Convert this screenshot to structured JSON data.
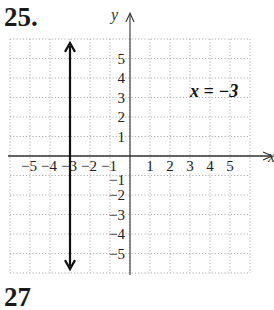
{
  "problem": {
    "number": "25.",
    "next_number_partial": "27",
    "next_axis_label_partial": "y"
  },
  "chart_data": {
    "type": "line",
    "title": "",
    "equation_label": "x = −3",
    "xlabel": "x",
    "ylabel": "y",
    "xlim": [
      -6,
      6
    ],
    "ylim": [
      -6,
      6
    ],
    "grid": true,
    "grid_style": "dotted",
    "x_tick_labels": [
      "−5",
      "−4",
      "−3",
      "−2",
      "−1",
      "1",
      "2",
      "3",
      "4",
      "5"
    ],
    "y_tick_labels": [
      "5",
      "4",
      "3",
      "2",
      "1",
      "−1",
      "−2",
      "−3",
      "−4",
      "−5"
    ],
    "series": [
      {
        "name": "x = −3",
        "kind": "vertical-line",
        "x": [
          -3,
          -3
        ],
        "y": [
          -5.8,
          5.8
        ],
        "arrows": "both",
        "color": "#111111"
      }
    ]
  },
  "colors": {
    "grid": "#9a9a9a",
    "axis": "#333333",
    "line": "#111111"
  }
}
